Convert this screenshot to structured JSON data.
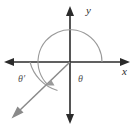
{
  "figure": {
    "background_color": "#ffffff",
    "width": 137,
    "height": 129
  },
  "axes": {
    "x_label": "x",
    "y_label": "y",
    "axis_color": "#2b2b2b",
    "origin": {
      "x": 70,
      "y": 62
    },
    "x_axis": {
      "left_end": 4,
      "right_end": 130,
      "arrows": "both"
    },
    "y_axis": {
      "top_end": 6,
      "bottom_end": 124,
      "arrows": "both"
    }
  },
  "ray": {
    "name": "terminal-side",
    "color": "#8a8a8a",
    "from": {
      "x": 70,
      "y": 62
    },
    "to": {
      "x": 13,
      "y": 117
    },
    "quadrant": "III",
    "arrow": "terminal-end"
  },
  "angles": [
    {
      "id": "theta",
      "label": "θ",
      "description": "Standard position angle measured from the positive x-axis counterclockwise to the terminal side",
      "label_position": {
        "x": 78,
        "y": 81
      },
      "arc_color": "#9a9a9a",
      "arc_radius": 32,
      "start_ray": "positive-x-axis",
      "end_ray": "terminal-side"
    },
    {
      "id": "theta-prime",
      "label": "θ′",
      "description": "Reference angle measured from the negative x-axis to the terminal side",
      "label_position": {
        "x": 18,
        "y": 80
      },
      "arc_color": "#9a9a9a",
      "arc_radius": 40,
      "start_ray": "negative-x-axis",
      "end_ray": "terminal-side"
    }
  ]
}
